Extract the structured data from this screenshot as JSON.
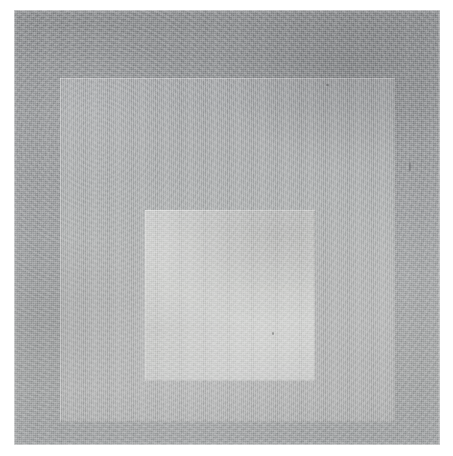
{
  "artwork": {
    "title": "Nested Squares Study",
    "form": "three concentric squares, inner squares offset toward the lower edge",
    "medium_appearance": "textured handmade paper with matte pigment wash",
    "canvas": {
      "width_px": 453,
      "height_px": 456,
      "background_color": "#ffffff"
    },
    "plate": {
      "name": "paper-plate",
      "left_px": 14,
      "top_px": 10,
      "width_px": 426,
      "height_px": 435,
      "edge_description": "soft deckled edge with pale halo against the white ground"
    },
    "fields": [
      {
        "name": "outer-field",
        "label": "Outer field",
        "color": "#9a9c9e",
        "color_top": "#8d8f91",
        "color_bottom": "#a0a2a3",
        "left_px": 14,
        "top_px": 10,
        "width_px": 426,
        "height_px": 435,
        "tone": "darkest gray, graded lighter toward the bottom"
      },
      {
        "name": "middle-field",
        "label": "Middle field",
        "color": "#aeb0b0",
        "color_top": "#a3a5a7",
        "color_bottom": "#acadad",
        "left_px": 60,
        "top_px": 78,
        "width_px": 335,
        "height_px": 344,
        "tone": "medium gray, slightly warm"
      },
      {
        "name": "inner-field",
        "label": "Inner field",
        "color": "#cccdcb",
        "color_top": "#c4c5c4",
        "color_bottom": "#c3c4c3",
        "left_px": 145,
        "top_px": 210,
        "width_px": 170,
        "height_px": 171,
        "tone": "lightest gray, highest value in the composition"
      }
    ],
    "palette": {
      "ground": "#ffffff",
      "outer": "#9a9c9e",
      "middle": "#aeb0b0",
      "inner": "#cccdcb"
    },
    "texture": {
      "grain": "fine woven paper tooth",
      "mottle": "uneven pigment pooling, darker at upper right, lighter at lower left",
      "striation": "faint vertical brush striation"
    }
  }
}
